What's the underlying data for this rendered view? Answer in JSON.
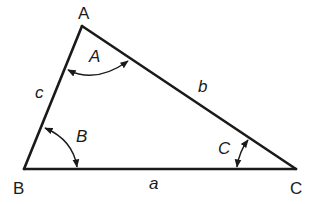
{
  "diagram": {
    "colors": {
      "stroke": "#1a1a1a",
      "background": "#ffffff"
    },
    "vertices": {
      "A": {
        "label": "A",
        "x": 82,
        "y": 26
      },
      "B": {
        "label": "B",
        "x": 24,
        "y": 169
      },
      "C": {
        "label": "C",
        "x": 296,
        "y": 169
      }
    },
    "sides": {
      "a": {
        "label": "a",
        "from": "B",
        "to": "C"
      },
      "b": {
        "label": "b",
        "from": "A",
        "to": "C"
      },
      "c": {
        "label": "c",
        "from": "A",
        "to": "B"
      }
    },
    "angles": {
      "A": {
        "label": "A",
        "vertex": "A"
      },
      "B": {
        "label": "B",
        "vertex": "B"
      },
      "C": {
        "label": "C",
        "vertex": "C"
      }
    }
  }
}
